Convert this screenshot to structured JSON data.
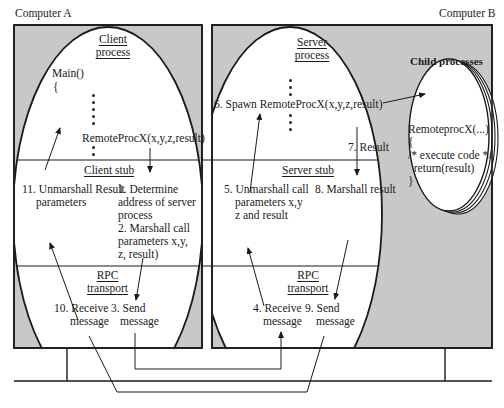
{
  "computers": {
    "a": {
      "label": "Computer A"
    },
    "b": {
      "label": "Computer B"
    }
  },
  "client": {
    "process_title": [
      "Client",
      "process"
    ],
    "main_lines": [
      "Main()",
      "{"
    ],
    "call": "RemoteProcX(x,y,z,result)",
    "stub_title": "Client stub",
    "step11": [
      "11. Unmarshall Result",
      "parameters"
    ],
    "step1_2": [
      "1. Determine",
      "address of server",
      "process",
      "2. Marshall call",
      "parameters x,y,",
      "z, result)"
    ],
    "transport_title": [
      "RPC",
      "transport"
    ],
    "step10": [
      "10. Receive",
      "message"
    ],
    "step3": [
      "3. Send",
      "message"
    ]
  },
  "server": {
    "process_title": [
      "Server",
      "process"
    ],
    "spawn": "6. Spawn RemoteProcX(x,y,z,result)",
    "step7": "7. Result",
    "stub_title": "Server stub",
    "step5": [
      "5. Unmarshall call",
      "parameters x,y",
      "z and result"
    ],
    "step8": "8. Marshall result",
    "transport_title": [
      "RPC",
      "transport"
    ],
    "step4": [
      "4. Receive",
      "message"
    ],
    "step9": [
      "9. Send",
      "message"
    ]
  },
  "child": {
    "title": "Child processes",
    "code": [
      "RemoteprocX(...)",
      "{",
      "/* execute code */",
      "  return(result)",
      "}"
    ]
  },
  "colors": {
    "box_fill": "#c8c8c8",
    "line": "#1a1a1a",
    "ellipse_fill": "#ffffff"
  }
}
